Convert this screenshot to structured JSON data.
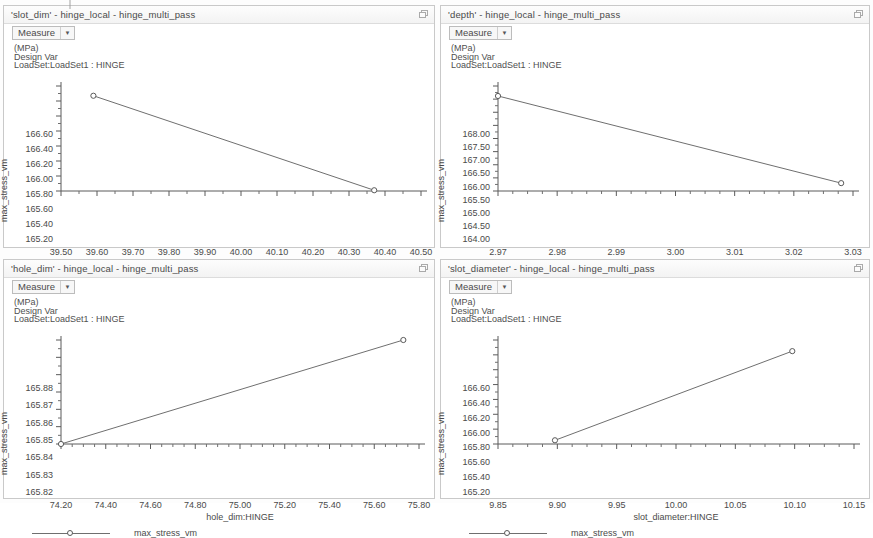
{
  "window": {
    "restore_icon": "restore-window-icon"
  },
  "common": {
    "measure_label": "Measure",
    "caret_icon": "chevron-down-icon",
    "annotation": [
      "(MPa)",
      "Design Var",
      "LoadSet:LoadSet1 : HINGE"
    ],
    "legend_label": "max_stress_vm",
    "y_axis_label": "max_stress_vm",
    "study": "hinge_local - hinge_multi_pass",
    "line_color": "#6f6f6f",
    "marker_color": "#5a5a5a",
    "panel_border_color": "#c9c9c9"
  },
  "panels": [
    {
      "title": "'slot_dim' - hinge_local - hinge_multi_pass",
      "x_label": "slot_dim:HINGE"
    },
    {
      "title": "'depth' - hinge_local - hinge_multi_pass",
      "x_label": "depth:HINGE"
    },
    {
      "title": "'hole_dim' - hinge_local - hinge_multi_pass",
      "x_label": "hole_dim:HINGE"
    },
    {
      "title": "'slot_diameter' - hinge_local - hinge_multi_pass",
      "x_label": "slot_diameter:HINGE"
    }
  ],
  "chart_data": [
    {
      "type": "line",
      "title": "'slot_dim' - hinge_local - hinge_multi_pass",
      "xlabel": "slot_dim:HINGE",
      "ylabel": "max_stress_vm",
      "legend": [
        "max_stress_vm"
      ],
      "legend_position": "bottom",
      "grid": false,
      "xlim": [
        39.5,
        40.5
      ],
      "ylim": [
        165.2,
        166.6
      ],
      "xticks": [
        39.5,
        39.6,
        39.7,
        39.8,
        39.9,
        40.0,
        40.1,
        40.2,
        40.3,
        40.4,
        40.5
      ],
      "yticks": [
        165.2,
        165.4,
        165.6,
        165.8,
        166.0,
        166.2,
        166.4,
        166.6
      ],
      "xticklabels": [
        "39.50",
        "39.60",
        "39.70",
        "39.80",
        "39.90",
        "40.00",
        "40.10",
        "40.20",
        "40.30",
        "40.40",
        "40.50"
      ],
      "yticklabels": [
        "165.20",
        "165.40",
        "165.60",
        "165.80",
        "166.00",
        "166.20",
        "166.40",
        "166.60"
      ],
      "series": [
        {
          "name": "max_stress_vm",
          "x": [
            39.59,
            40.37
          ],
          "y": [
            166.47,
            165.21
          ]
        }
      ]
    },
    {
      "type": "line",
      "title": "'depth' - hinge_local - hinge_multi_pass",
      "xlabel": "depth:HINGE",
      "ylabel": "max_stress_vm",
      "legend": [
        "max_stress_vm"
      ],
      "legend_position": "bottom",
      "grid": false,
      "xlim": [
        2.97,
        3.03
      ],
      "ylim": [
        164.0,
        168.0
      ],
      "xticks": [
        2.97,
        2.98,
        2.99,
        3.0,
        3.01,
        3.02,
        3.03
      ],
      "yticks": [
        164.0,
        164.5,
        165.0,
        165.5,
        166.0,
        166.5,
        167.0,
        167.5,
        168.0
      ],
      "xticklabels": [
        "2.97",
        "2.98",
        "2.99",
        "3.00",
        "3.01",
        "3.02",
        "3.03"
      ],
      "yticklabels": [
        "164.00",
        "164.50",
        "165.00",
        "165.50",
        "166.00",
        "166.50",
        "167.00",
        "167.50",
        "168.00"
      ],
      "series": [
        {
          "name": "max_stress_vm",
          "x": [
            2.97,
            3.028
          ],
          "y": [
            167.62,
            164.3
          ]
        }
      ]
    },
    {
      "type": "line",
      "title": "'hole_dim' - hinge_local - hinge_multi_pass",
      "xlabel": "hole_dim:HINGE",
      "ylabel": "max_stress_vm",
      "legend": [
        "max_stress_vm"
      ],
      "legend_position": "bottom",
      "grid": false,
      "xlim": [
        74.2,
        75.8
      ],
      "ylim": [
        165.82,
        165.88
      ],
      "xticks": [
        74.2,
        74.4,
        74.6,
        74.8,
        75.0,
        75.2,
        75.4,
        75.6,
        75.8
      ],
      "yticks": [
        165.82,
        165.83,
        165.84,
        165.85,
        165.86,
        165.87,
        165.88
      ],
      "xticklabels": [
        "74.20",
        "74.40",
        "74.60",
        "74.80",
        "75.00",
        "75.20",
        "75.40",
        "75.60",
        "75.80"
      ],
      "yticklabels": [
        "165.82",
        "165.83",
        "165.84",
        "165.85",
        "165.86",
        "165.87",
        "165.88"
      ],
      "series": [
        {
          "name": "max_stress_vm",
          "x": [
            74.2,
            75.73
          ],
          "y": [
            165.82,
            165.88
          ]
        }
      ]
    },
    {
      "type": "line",
      "title": "'slot_diameter' - hinge_local - hinge_multi_pass",
      "xlabel": "slot_diameter:HINGE",
      "ylabel": "max_stress_vm",
      "legend": [
        "max_stress_vm"
      ],
      "legend_position": "bottom",
      "grid": false,
      "xlim": [
        9.85,
        10.15
      ],
      "ylim": [
        165.2,
        166.6
      ],
      "xticks": [
        9.85,
        9.9,
        9.95,
        10.0,
        10.05,
        10.1,
        10.15
      ],
      "yticks": [
        165.2,
        165.4,
        165.6,
        165.8,
        166.0,
        166.2,
        166.4,
        166.6
      ],
      "xticklabels": [
        "9.85",
        "9.90",
        "9.95",
        "10.00",
        "10.05",
        "10.10",
        "10.15"
      ],
      "yticklabels": [
        "165.20",
        "165.40",
        "165.60",
        "165.80",
        "166.00",
        "166.20",
        "166.40",
        "166.60"
      ],
      "series": [
        {
          "name": "max_stress_vm",
          "x": [
            9.898,
            10.098
          ],
          "y": [
            165.25,
            166.45
          ]
        }
      ]
    }
  ]
}
